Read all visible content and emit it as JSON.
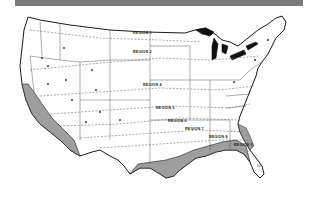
{
  "header_bar": {
    "color": "#7a7a7a"
  },
  "map": {
    "subject": "Contiguous United States climate/region map",
    "colors": {
      "land": "#ffffff",
      "outline": "#1a1a1a",
      "shaded_zone": "#9e9e9e",
      "boundary_dashed": "#555555"
    },
    "region_labels": [
      {
        "text": "REGION 1",
        "x": 133,
        "y": 34
      },
      {
        "text": "REGION 2",
        "x": 133,
        "y": 53
      },
      {
        "text": "REGION 4",
        "x": 143,
        "y": 86
      },
      {
        "text": "REGION 5",
        "x": 156,
        "y": 109
      },
      {
        "text": "REGION 6",
        "x": 168,
        "y": 122
      },
      {
        "text": "REGION 7",
        "x": 185,
        "y": 130
      },
      {
        "text": "REGION 8",
        "x": 209,
        "y": 138
      },
      {
        "text": "REGION 9",
        "x": 234,
        "y": 146
      }
    ],
    "florida_label": {
      "text": "10",
      "x": 261,
      "y": 167
    }
  }
}
